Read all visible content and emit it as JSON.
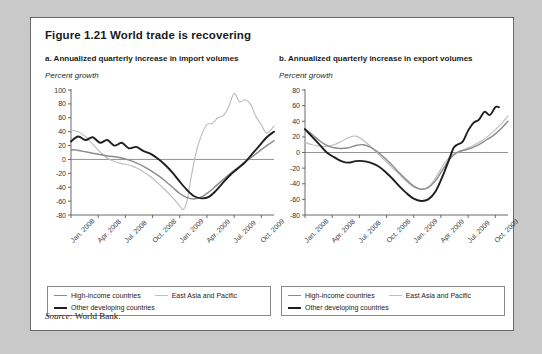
{
  "figure": {
    "number": "Figure 1.21",
    "title": "Figure 1.21  World trade is recovering",
    "source_prefix": "Source:",
    "source_text": " World Bank."
  },
  "legend": {
    "items": [
      {
        "label": "High-income countries",
        "color": "#8c8c8c",
        "width": 1.6
      },
      {
        "label": "East Asia and Pacific",
        "color": "#bdbdbd",
        "width": 1.3
      },
      {
        "label": "Other developing countries",
        "color": "#1f1f1f",
        "width": 2.0
      }
    ]
  },
  "chart_data": [
    {
      "type": "line",
      "panel": "a",
      "title": "a. Annualized quarterly increase in import volumes",
      "ylabel": "Percent growth",
      "xlabel": "",
      "ylim": [
        -80,
        100
      ],
      "yticks": [
        100,
        80,
        60,
        40,
        20,
        0,
        -20,
        -40,
        -60,
        -80
      ],
      "yticklabels": [
        "100",
        "80",
        "60",
        "40",
        "20",
        "0",
        "-20",
        "-40",
        "-60",
        "-80"
      ],
      "grid": false,
      "zero_line": true,
      "legend_position": "below",
      "x": [
        "Jan. 2008",
        "Apr. 2008",
        "Jul. 2008",
        "Oct. 2008",
        "Jan. 2009",
        "Apr. 2009",
        "Jul. 2009",
        "Oct. 2009"
      ],
      "xticklabels": [
        "Jan. 2008",
        "Apr. 2008",
        "Jul. 2008",
        "Oct. 2008",
        "Jan. 2009",
        "Apr. 2009",
        "Jul. 2009",
        "Oct. 2009"
      ],
      "x_months": [
        0,
        3,
        6,
        9,
        12,
        15,
        18,
        21
      ],
      "series": [
        {
          "name": "High-income countries",
          "color": "#8c8c8c",
          "x_months": [
            0,
            0.8,
            1.6,
            2.4,
            3.2,
            4.0,
            4.8,
            5.6,
            6.4,
            7.2,
            8.0,
            8.8,
            9.6,
            10.4,
            11.2,
            12.0,
            12.8,
            13.6,
            14.4,
            15.2,
            16.0,
            16.8,
            17.6,
            18.4,
            19.2,
            20.0,
            20.8,
            21.6,
            22.4
          ],
          "values": [
            14,
            13,
            11,
            9,
            7,
            5,
            4,
            2,
            -1,
            -5,
            -10,
            -16,
            -23,
            -31,
            -40,
            -49,
            -55,
            -57,
            -54,
            -47,
            -38,
            -29,
            -20,
            -12,
            -4,
            4,
            12,
            20,
            27
          ]
        },
        {
          "name": "East Asia and Pacific",
          "color": "#bdbdbd",
          "x_months": [
            0,
            0.8,
            1.6,
            2.4,
            3.2,
            4.0,
            4.8,
            5.6,
            6.4,
            7.2,
            8.0,
            8.8,
            9.6,
            10.4,
            11.2,
            12.0,
            12.4,
            12.8,
            13.2,
            13.8,
            14.4,
            15.0,
            15.6,
            16.2,
            16.8,
            17.4,
            18.0,
            18.6,
            19.2,
            19.8,
            20.4,
            21.0,
            21.6,
            22.4
          ],
          "values": [
            42,
            40,
            33,
            22,
            11,
            2,
            -3,
            -6,
            -8,
            -12,
            -18,
            -25,
            -34,
            -44,
            -55,
            -67,
            -72,
            -60,
            -30,
            10,
            35,
            50,
            52,
            60,
            63,
            76,
            95,
            83,
            86,
            80,
            62,
            50,
            38,
            48
          ]
        },
        {
          "name": "Other developing countries",
          "color": "#1f1f1f",
          "x_months": [
            0,
            0.8,
            1.6,
            2.4,
            3.2,
            4.0,
            4.8,
            5.6,
            6.4,
            7.2,
            8.0,
            8.8,
            9.6,
            10.4,
            11.2,
            12.0,
            12.8,
            13.6,
            14.4,
            15.2,
            16.0,
            16.8,
            17.6,
            18.4,
            19.2,
            20.0,
            20.8,
            21.6,
            22.4
          ],
          "values": [
            26,
            33,
            28,
            32,
            24,
            28,
            20,
            24,
            16,
            18,
            12,
            8,
            1,
            -8,
            -19,
            -32,
            -44,
            -53,
            -56,
            -54,
            -45,
            -33,
            -22,
            -13,
            -4,
            8,
            20,
            32,
            40
          ]
        }
      ]
    },
    {
      "type": "line",
      "panel": "b",
      "title": "b. Annualized quarterly increase in export volumes",
      "ylabel": "Percent growth",
      "xlabel": "",
      "ylim": [
        -80,
        80
      ],
      "yticks": [
        80,
        60,
        40,
        20,
        0,
        -20,
        -40,
        -60,
        -80
      ],
      "yticklabels": [
        "80",
        "60",
        "40",
        "20",
        "0",
        "-20",
        "-40",
        "-60",
        "-80"
      ],
      "grid": false,
      "zero_line": true,
      "legend_position": "below",
      "x": [
        "Jan. 2008",
        "Apr. 2008",
        "Jul. 2008",
        "Oct. 2008",
        "Jan. 2009",
        "Apr. 2009",
        "Jul. 2009",
        "Oct. 2009"
      ],
      "xticklabels": [
        "Jan. 2008",
        "Apr. 2008",
        "Jul. 2008",
        "Oct. 2008",
        "Jan. 2009",
        "Apr. 2009",
        "Jul. 2009",
        "Oct. 2009"
      ],
      "x_months": [
        0,
        3,
        6,
        9,
        12,
        15,
        18,
        21
      ],
      "series": [
        {
          "name": "High-income countries",
          "color": "#8c8c8c",
          "x_months": [
            0,
            0.8,
            1.6,
            2.4,
            3.2,
            4.0,
            4.8,
            5.6,
            6.4,
            7.2,
            8.0,
            8.8,
            9.6,
            10.4,
            11.2,
            12.0,
            12.8,
            13.6,
            14.4,
            15.2,
            16.0,
            16.8,
            17.6,
            18.4,
            19.2,
            20.0,
            20.8,
            21.6,
            22.4
          ],
          "values": [
            30,
            23,
            15,
            9,
            6,
            5,
            6,
            9,
            10,
            7,
            1,
            -7,
            -16,
            -26,
            -35,
            -43,
            -47,
            -45,
            -36,
            -22,
            -8,
            0,
            3,
            6,
            10,
            16,
            22,
            30,
            40
          ]
        },
        {
          "name": "East Asia and Pacific",
          "color": "#bdbdbd",
          "x_months": [
            0,
            0.8,
            1.6,
            2.4,
            3.2,
            4.0,
            4.8,
            5.6,
            6.4,
            7.2,
            8.0,
            8.8,
            9.6,
            10.4,
            11.2,
            12.0,
            12.8,
            13.6,
            14.4,
            15.2,
            16.0,
            16.8,
            17.6,
            18.4,
            19.2,
            20.0,
            20.8,
            21.6,
            22.4
          ],
          "values": [
            13,
            10,
            8,
            8,
            10,
            14,
            19,
            21,
            16,
            8,
            -1,
            -10,
            -19,
            -28,
            -37,
            -44,
            -47,
            -44,
            -33,
            -17,
            -5,
            0,
            4,
            8,
            13,
            19,
            27,
            36,
            47
          ]
        },
        {
          "name": "Other developing countries",
          "color": "#1f1f1f",
          "x_months": [
            0,
            0.8,
            1.6,
            2.4,
            3.2,
            4.0,
            4.8,
            5.6,
            6.4,
            7.2,
            8.0,
            8.8,
            9.6,
            10.4,
            11.2,
            12.0,
            12.8,
            13.6,
            14.4,
            15.2,
            16.0,
            16.4,
            16.8,
            17.4,
            18.0,
            18.6,
            19.2,
            19.8,
            20.4,
            21.0,
            21.4
          ],
          "values": [
            30,
            20,
            10,
            0,
            -6,
            -11,
            -13,
            -11,
            -11,
            -13,
            -17,
            -24,
            -33,
            -43,
            -52,
            -59,
            -62,
            -60,
            -50,
            -30,
            -6,
            6,
            10,
            14,
            28,
            38,
            42,
            52,
            48,
            58,
            58
          ]
        }
      ]
    }
  ]
}
